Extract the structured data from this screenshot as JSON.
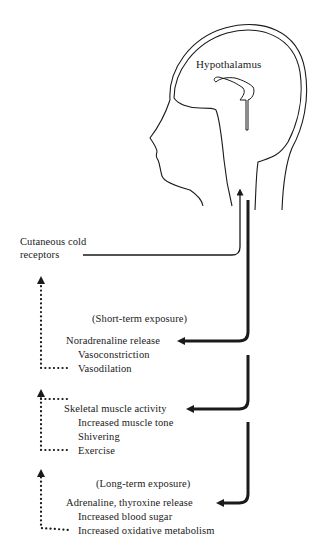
{
  "diagram": {
    "head_label": "Hypothalamus",
    "input": {
      "line1": "Cutaneous cold",
      "line2": "receptors"
    },
    "groups": [
      {
        "heading": "(Short-term exposure)",
        "lead": "Noradrenaline release",
        "items": [
          "Vasoconstriction",
          "Vasodilation"
        ]
      },
      {
        "heading": "",
        "lead": "Skeletal muscle activity",
        "items": [
          "Increased muscle tone",
          "Shivering",
          "Exercise"
        ]
      },
      {
        "heading": "(Long-term exposure)",
        "lead": "Adrenaline, thyroxine release",
        "items": [
          "Increased blood sugar",
          "Increased oxidative metabolism"
        ]
      }
    ],
    "legend": {
      "solid_thin": "afferent signal from receptors to hypothalamus",
      "solid_thick": "efferent responses from hypothalamus",
      "dotted": "feedback to cutaneous cold receptors"
    },
    "colors": {
      "ink": "#1a1a1a",
      "background": "#ffffff"
    }
  }
}
